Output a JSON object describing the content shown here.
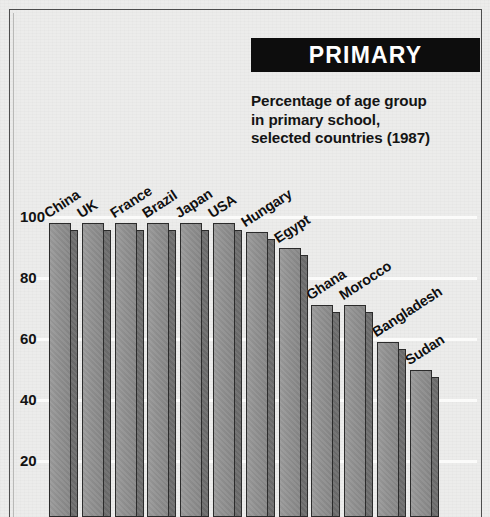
{
  "header": {
    "badge_label": "PRIMARY",
    "subtitle_lines": [
      "Percentage of age group",
      "in primary school,",
      "selected countries (1987)"
    ]
  },
  "colors": {
    "badge_background": "#0d0d0d",
    "badge_text": "#ffffff",
    "bar_face": "#8a8a8a",
    "bar_side": "#6f6f6f",
    "bar_outline": "#2b2b2b",
    "page_background": "#ececeb",
    "gridline": "#fbfbfa",
    "text": "#131313"
  },
  "chart_data": {
    "type": "bar",
    "title": "PRIMARY",
    "subtitle": "Percentage of age group in primary school, selected countries (1987)",
    "xlabel": "",
    "ylabel": "",
    "ylim": [
      0,
      108
    ],
    "yticks": [
      100,
      80,
      60,
      40,
      20
    ],
    "ytick_labels": [
      "100",
      "80",
      "60",
      "40",
      "20"
    ],
    "grid": true,
    "legend": "none",
    "categories": [
      "China",
      "UK",
      "France",
      "Brazil",
      "Japan",
      "USA",
      "Hungary",
      "Egypt",
      "Ghana",
      "Morocco",
      "Bangladesh",
      "Sudan"
    ],
    "values": [
      98,
      98,
      98,
      98,
      98,
      98,
      95,
      90,
      71,
      71,
      59,
      50
    ]
  }
}
